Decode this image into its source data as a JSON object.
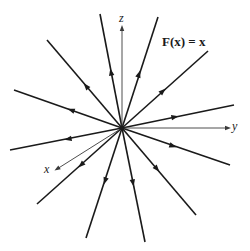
{
  "title": "F(x) = x",
  "axes": {
    "z": {
      "label": "z",
      "end": [
        122,
        28
      ],
      "label_pos": [
        119,
        13
      ]
    },
    "y": {
      "label": "y",
      "end": [
        228,
        128
      ],
      "label_pos": [
        232,
        121
      ]
    },
    "x": {
      "label": "x",
      "end": [
        57,
        169
      ],
      "label_pos": [
        44,
        163
      ]
    }
  },
  "origin": [
    122,
    128
  ],
  "field_lines": [
    {
      "name": "field-line-top-left",
      "start": [
        122,
        128
      ],
      "end": [
        100,
        14
      ],
      "arrow": [
        111,
        72
      ]
    },
    {
      "name": "field-line-top-right",
      "start": [
        122,
        128
      ],
      "end": [
        158,
        17
      ],
      "arrow": [
        139,
        74
      ]
    },
    {
      "name": "field-line-upper-left",
      "start": [
        122,
        128
      ],
      "end": [
        47,
        40
      ],
      "arrow": [
        86,
        86
      ]
    },
    {
      "name": "field-line-upper-right",
      "start": [
        122,
        128
      ],
      "end": [
        208,
        51
      ],
      "arrow": [
        163,
        91
      ]
    },
    {
      "name": "field-line-left-upper",
      "start": [
        122,
        128
      ],
      "end": [
        14,
        90
      ],
      "arrow": [
        71,
        110
      ]
    },
    {
      "name": "field-line-right-upper",
      "start": [
        122,
        128
      ],
      "end": [
        234,
        105
      ],
      "arrow": [
        175,
        117
      ]
    },
    {
      "name": "field-line-left-lower",
      "start": [
        122,
        128
      ],
      "end": [
        10,
        150
      ],
      "arrow": [
        68,
        139
      ]
    },
    {
      "name": "field-line-right-lower",
      "start": [
        122,
        128
      ],
      "end": [
        230,
        165
      ],
      "arrow": [
        173,
        146
      ]
    },
    {
      "name": "field-line-lower-left",
      "start": [
        122,
        128
      ],
      "end": [
        37,
        204
      ],
      "arrow": [
        81,
        165
      ]
    },
    {
      "name": "field-line-lower-right",
      "start": [
        122,
        128
      ],
      "end": [
        196,
        215
      ],
      "arrow": [
        157,
        169
      ]
    },
    {
      "name": "field-line-bottom-left",
      "start": [
        122,
        128
      ],
      "end": [
        86,
        238
      ],
      "arrow": [
        105,
        181
      ]
    },
    {
      "name": "field-line-bottom-right",
      "start": [
        122,
        128
      ],
      "end": [
        145,
        242
      ],
      "arrow": [
        133,
        183
      ]
    }
  ],
  "colors": {
    "line": "#1a1a1a",
    "axis": "#3a3a3a",
    "background": "#ffffff"
  }
}
